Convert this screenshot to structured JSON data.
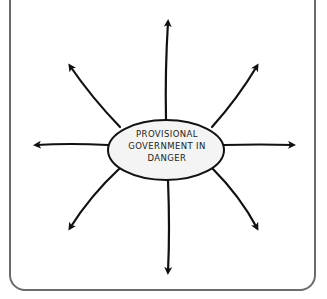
{
  "diagram": {
    "type": "mind-map",
    "center_label_lines": [
      "PROVISIONAL",
      "GOVERNMENT IN",
      "DANGER"
    ],
    "center_label": "PROVISIONAL GOVERNMENT IN DANGER",
    "branch_count": 8,
    "branches": [
      {
        "direction": "up",
        "label": ""
      },
      {
        "direction": "up-right",
        "label": ""
      },
      {
        "direction": "right",
        "label": ""
      },
      {
        "direction": "down-right",
        "label": ""
      },
      {
        "direction": "down",
        "label": ""
      },
      {
        "direction": "down-left",
        "label": ""
      },
      {
        "direction": "left",
        "label": ""
      },
      {
        "direction": "up-left",
        "label": ""
      }
    ],
    "colors": {
      "stroke": "#111111",
      "frame": "#6b6b6b",
      "ellipse_fill": "#f4f4f4"
    }
  }
}
